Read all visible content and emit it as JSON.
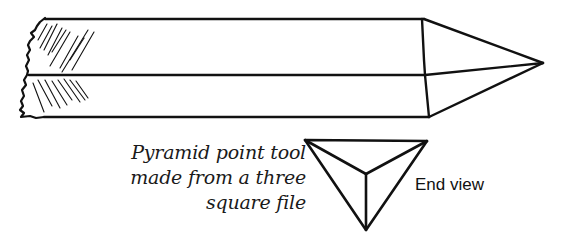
{
  "figure": {
    "caption_lines": [
      "Pyramid point tool",
      "made from a three",
      "square file"
    ],
    "end_view_label": "End view",
    "stroke_color": "#111111"
  }
}
